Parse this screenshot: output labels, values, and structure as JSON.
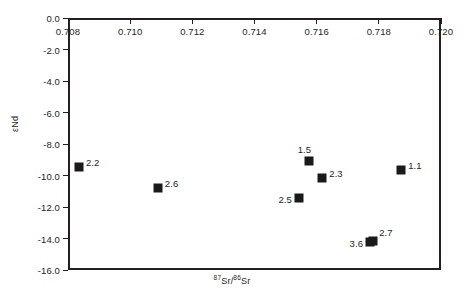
{
  "chart_data": {
    "type": "scatter",
    "title": "",
    "xlabel": "87Sr/86Sr",
    "ylabel": "eNd",
    "xlabel_parts": {
      "pre": "",
      "sup1": "87",
      "mid": "Sr/",
      "sup2": "86",
      "post": "Sr"
    },
    "ylabel_text": "εNd",
    "xlim": [
      0.708,
      0.72
    ],
    "ylim": [
      -16.0,
      0.0
    ],
    "xticks": [
      "0.708",
      "0.710",
      "0.712",
      "0.714",
      "0.716",
      "0.718",
      "0.720"
    ],
    "xtick_values": [
      0.708,
      0.71,
      0.712,
      0.714,
      0.716,
      0.718,
      0.72
    ],
    "yticks": [
      "0.0",
      "-2.0",
      "-4.0",
      "-6.0",
      "-8.0",
      "-10.0",
      "-12.0",
      "-14.0",
      "-16.0"
    ],
    "ytick_values": [
      0.0,
      -2.0,
      -4.0,
      -6.0,
      -8.0,
      -10.0,
      -12.0,
      -14.0,
      -16.0
    ],
    "grid": false,
    "legend": "none",
    "marker": "filled-square",
    "marker_color": "#1a1a1a",
    "points": [
      {
        "label": "2.2",
        "x": 0.70835,
        "y": -9.45,
        "label_pos": "right"
      },
      {
        "label": "2.6",
        "x": 0.71089,
        "y": -10.8,
        "label_pos": "right"
      },
      {
        "label": "2.5",
        "x": 0.71543,
        "y": -11.43,
        "label_pos": "left"
      },
      {
        "label": "1.5",
        "x": 0.71576,
        "y": -9.08,
        "label_pos": "left-above"
      },
      {
        "label": "2.3",
        "x": 0.71618,
        "y": -10.16,
        "label_pos": "right"
      },
      {
        "label": "3.6",
        "x": 0.71772,
        "y": -14.25,
        "label_pos": "left"
      },
      {
        "label": "2.7",
        "x": 0.71782,
        "y": -14.13,
        "label_pos": "right-above"
      },
      {
        "label": "1.1",
        "x": 0.71872,
        "y": -9.62,
        "label_pos": "right"
      }
    ]
  }
}
